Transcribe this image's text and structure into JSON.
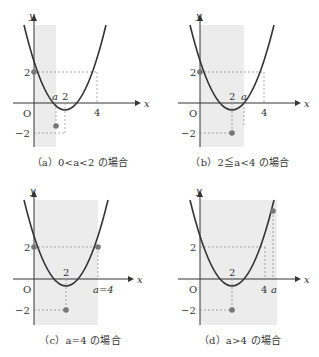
{
  "panels": [
    {
      "id": "a",
      "caption": "（a）0<a<2 の場合",
      "labels": {
        "y_axis": "y",
        "x_axis": "x",
        "origin": "O",
        "y_top": "2",
        "y_bottom": "−2",
        "x_a": "a",
        "x_2": "2",
        "x_4": "4"
      }
    },
    {
      "id": "b",
      "caption": "（b）2≦a<4 の場合",
      "labels": {
        "y_axis": "y",
        "x_axis": "x",
        "origin": "O",
        "y_top": "2",
        "y_bottom": "−2",
        "x_2": "2",
        "x_a": "a",
        "x_4": "4"
      }
    },
    {
      "id": "c",
      "caption": "（c）a=4 の場合",
      "labels": {
        "y_axis": "y",
        "x_axis": "x",
        "origin": "O",
        "y_top": "2",
        "y_bottom": "−2",
        "x_2": "2",
        "x_a4": "a=4"
      }
    },
    {
      "id": "d",
      "caption": "（d）a>4 の場合",
      "labels": {
        "y_axis": "y",
        "x_axis": "x",
        "origin": "O",
        "y_top": "2",
        "y_bottom": "−2",
        "x_2": "2",
        "x_4": "4",
        "x_a": "a"
      }
    }
  ],
  "colors": {
    "curve": "#333333",
    "shade": "#ececec",
    "point": "#777777",
    "dash": "#888888"
  }
}
